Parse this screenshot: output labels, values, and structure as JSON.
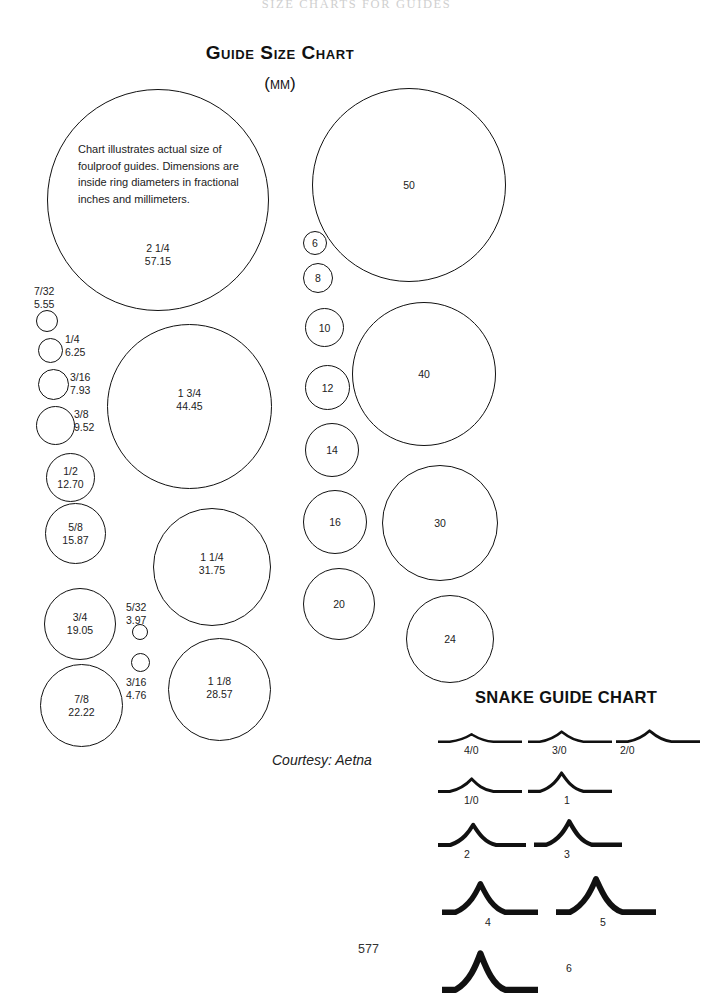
{
  "page": {
    "running_head": "SIZE CHARTS FOR GUIDES",
    "title": "Guide Size Chart",
    "subtitle": "(mm)",
    "courtesy": "Courtesy: Aetna",
    "page_number": "577",
    "description": "Chart illustrates actual size of foulproof guides. Dimensions are inside ring diameters in fractional inches and millimeters."
  },
  "inch_rings": [
    {
      "name": "ring-2-1-4",
      "fraction": "2 1/4",
      "mm": "57.15",
      "x": 47,
      "y": 89,
      "d": 222,
      "label_x": 0,
      "label_y": 152,
      "label_pos": "inside"
    },
    {
      "name": "ring-1-3-4",
      "fraction": "1 3/4",
      "mm": "44.45",
      "x": 107,
      "y": 324,
      "d": 165,
      "label_x": 0,
      "label_y": 62,
      "label_pos": "inside"
    },
    {
      "name": "ring-1-1-4",
      "fraction": "1 1/4",
      "mm": "31.75",
      "x": 153,
      "y": 508,
      "d": 118,
      "label_x": 0,
      "label_y": 42,
      "label_pos": "inside"
    },
    {
      "name": "ring-1-1-8",
      "fraction": "1 1/8",
      "mm": "28.57",
      "x": 168,
      "y": 638,
      "d": 103,
      "label_x": 0,
      "label_y": 36,
      "label_pos": "inside"
    },
    {
      "name": "ring-7-8",
      "fraction": "7/8",
      "mm": "22.22",
      "x": 40,
      "y": 664,
      "d": 83,
      "label_x": 0,
      "label_y": 28,
      "label_pos": "inside"
    },
    {
      "name": "ring-3-4",
      "fraction": "3/4",
      "mm": "19.05",
      "x": 44,
      "y": 588,
      "d": 72,
      "label_x": 0,
      "label_y": 22,
      "label_pos": "inside"
    },
    {
      "name": "ring-5-8",
      "fraction": "5/8",
      "mm": "15.87",
      "x": 45,
      "y": 503,
      "d": 61,
      "label_x": 0,
      "label_y": 17,
      "label_pos": "inside"
    },
    {
      "name": "ring-1-2",
      "fraction": "1/2",
      "mm": "12.70",
      "x": 46,
      "y": 453,
      "d": 49,
      "label_x": 0,
      "label_y": 11,
      "label_pos": "inside"
    }
  ],
  "inch_rings_side": [
    {
      "name": "ring-7-32",
      "fraction": "7/32",
      "mm": "5.55",
      "x": 36,
      "y": 310,
      "d": 22,
      "label_x": 34,
      "label_y": 285,
      "side": "above"
    },
    {
      "name": "ring-1-4",
      "fraction": "1/4",
      "mm": "6.25",
      "x": 38,
      "y": 338,
      "d": 25,
      "label_x": 65,
      "label_y": 333,
      "side": "right"
    },
    {
      "name": "ring-3-16",
      "fraction": "3/16",
      "mm": "7.93",
      "x": 38,
      "y": 369,
      "d": 31,
      "label_x": 70,
      "label_y": 371,
      "side": "right"
    },
    {
      "name": "ring-3-8",
      "fraction": "3/8",
      "mm": "9.52",
      "x": 36,
      "y": 406,
      "d": 39,
      "label_x": 74,
      "label_y": 408,
      "side": "right"
    },
    {
      "name": "ring-5-32",
      "fraction": "5/32",
      "mm": "3.97",
      "x": 132,
      "y": 624,
      "d": 16,
      "label_x": 126,
      "label_y": 601,
      "side": "above"
    },
    {
      "name": "ring-3-16b",
      "fraction": "3/16",
      "mm": "4.76",
      "x": 131,
      "y": 653,
      "d": 19,
      "label_x": 126,
      "label_y": 676,
      "side": "below"
    }
  ],
  "metric_rings": [
    {
      "name": "ring-50",
      "label": "50",
      "x": 312,
      "y": 88,
      "d": 194
    },
    {
      "name": "ring-40",
      "label": "40",
      "x": 352,
      "y": 302,
      "d": 144
    },
    {
      "name": "ring-30",
      "label": "30",
      "x": 382,
      "y": 465,
      "d": 116
    },
    {
      "name": "ring-24",
      "label": "24",
      "x": 406,
      "y": 595,
      "d": 88
    },
    {
      "name": "ring-20",
      "label": "20",
      "x": 303,
      "y": 568,
      "d": 72
    },
    {
      "name": "ring-16",
      "label": "16",
      "x": 303,
      "y": 490,
      "d": 64
    },
    {
      "name": "ring-14",
      "label": "14",
      "x": 305,
      "y": 423,
      "d": 54
    },
    {
      "name": "ring-12",
      "label": "12",
      "x": 305,
      "y": 365,
      "d": 45
    },
    {
      "name": "ring-10",
      "label": "10",
      "x": 305,
      "y": 308,
      "d": 39
    },
    {
      "name": "ring-8",
      "label": "8",
      "x": 303,
      "y": 263,
      "d": 30
    },
    {
      "name": "ring-6",
      "label": "6",
      "x": 303,
      "y": 231,
      "d": 24
    }
  ],
  "snake_chart": {
    "title": "SNAKE GUIDE CHART",
    "title_x": 475,
    "title_y": 688,
    "items": [
      {
        "name": "snake-4-0",
        "label": "4/0",
        "x": 438,
        "y": 712,
        "w": 84,
        "h": 32,
        "peak": 0.34,
        "thick": 2.4,
        "cap_x": 464,
        "cap_y": 744
      },
      {
        "name": "snake-3-0",
        "label": "3/0",
        "x": 528,
        "y": 710,
        "w": 84,
        "h": 34,
        "peak": 0.4,
        "thick": 2.6,
        "cap_x": 552,
        "cap_y": 744
      },
      {
        "name": "snake-2-0",
        "label": "2/0",
        "x": 616,
        "y": 709,
        "w": 84,
        "h": 35,
        "peak": 0.42,
        "thick": 2.8,
        "cap_x": 620,
        "cap_y": 744
      },
      {
        "name": "snake-1-0",
        "label": "1/0",
        "x": 438,
        "y": 758,
        "w": 84,
        "h": 36,
        "peak": 0.46,
        "thick": 3.0,
        "cap_x": 464,
        "cap_y": 794
      },
      {
        "name": "snake-1",
        "label": "1",
        "x": 528,
        "y": 753,
        "w": 84,
        "h": 41,
        "peak": 0.55,
        "thick": 3.2,
        "cap_x": 564,
        "cap_y": 794
      },
      {
        "name": "snake-2",
        "label": "2",
        "x": 438,
        "y": 806,
        "w": 88,
        "h": 42,
        "peak": 0.6,
        "thick": 4.0,
        "cap_x": 464,
        "cap_y": 848
      },
      {
        "name": "snake-3",
        "label": "3",
        "x": 534,
        "y": 803,
        "w": 88,
        "h": 45,
        "peak": 0.64,
        "thick": 4.4,
        "cap_x": 564,
        "cap_y": 848
      },
      {
        "name": "snake-4",
        "label": "4",
        "x": 442,
        "y": 866,
        "w": 96,
        "h": 50,
        "peak": 0.7,
        "thick": 5.4,
        "cap_x": 485,
        "cap_y": 916
      },
      {
        "name": "snake-5",
        "label": "5",
        "x": 556,
        "y": 862,
        "w": 100,
        "h": 54,
        "peak": 0.74,
        "thick": 5.8,
        "cap_x": 600,
        "cap_y": 916
      },
      {
        "name": "snake-6",
        "label": "6",
        "x": 442,
        "y": 938,
        "w": 96,
        "h": 56,
        "peak": 0.78,
        "thick": 6.2,
        "cap_x": 566,
        "cap_y": 962
      }
    ]
  }
}
